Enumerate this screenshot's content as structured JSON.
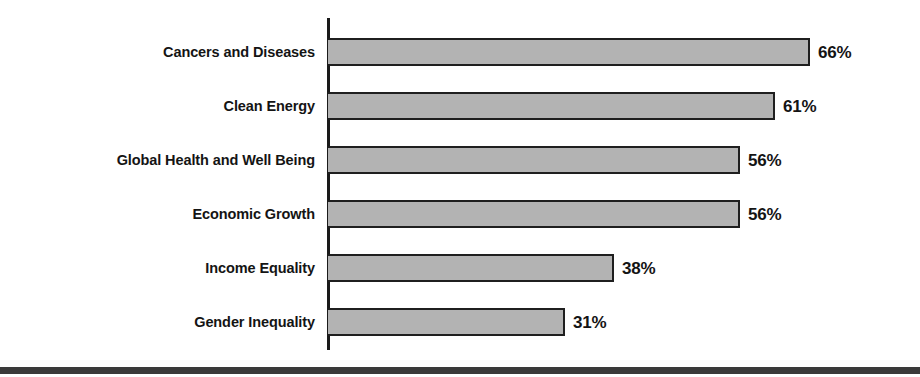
{
  "chart_data": {
    "type": "bar",
    "orientation": "horizontal",
    "title": "",
    "xlabel": "",
    "ylabel": "",
    "categories": [
      "Cancers and Diseases",
      "Clean Energy",
      "Global Health and Well Being",
      "Economic Growth",
      "Income Equality",
      "Gender Inequality"
    ],
    "values": [
      66,
      61,
      56,
      56,
      38,
      31
    ],
    "value_labels": [
      "66%",
      "61%",
      "56%",
      "56%",
      "38%",
      "31%"
    ],
    "unit": "%",
    "xlim": [
      0,
      70
    ],
    "grid": false,
    "legend": null,
    "bar_fill_color": "#b3b3b3",
    "bar_border_color": "#1f1f1f",
    "axis_color": "#1a1a1a",
    "text_color": "#141414"
  },
  "layout": {
    "axis_x": 328,
    "bar_height": 28,
    "row_pitch": 54,
    "first_row_top": 38,
    "px_per_unit": 7.0,
    "bar_base_offset": 20,
    "value_label_gap": 8,
    "bottom_rule_color": "#3a3a3a"
  }
}
